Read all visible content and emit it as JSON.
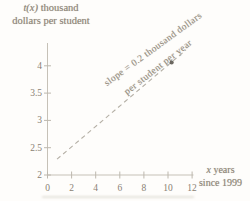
{
  "colors": {
    "background": "#fefdfb",
    "text": "#8e8577",
    "axis": "#c6c1b7",
    "tick": "#bdb8ae",
    "tick_label": "#8a8173",
    "dashed_line": "#b5b0a6",
    "point": "#57524a"
  },
  "ylabel": {
    "var": "t(x)",
    "rest": " thousand",
    "line2": "dollars per student"
  },
  "xlabel": {
    "var": "x",
    "rest": " years",
    "line2": "since 1999"
  },
  "annotation": {
    "line1": "slope = 0.2 thousand dollars",
    "line2": "per student per year"
  },
  "chart_data": {
    "type": "line",
    "title": "",
    "xlabel": "x years since 1999",
    "ylabel": "t(x) thousand dollars per student",
    "x_ticks": [
      0,
      2,
      4,
      6,
      8,
      10,
      12
    ],
    "y_ticks": [
      2,
      2.5,
      3,
      3.5,
      4
    ],
    "xlim": [
      0,
      12.2
    ],
    "ylim": [
      2,
      4.45
    ],
    "grid": false,
    "legend": "none",
    "series": [
      {
        "name": "t(x)",
        "style": "dashed",
        "slope": 0.2,
        "points": [
          [
            0.79,
            2.29
          ],
          [
            11.49,
            4.29
          ]
        ]
      }
    ],
    "marked_point": [
      10.3,
      4.06
    ],
    "annotation": "slope = 0.2 thousand dollars per student per year"
  }
}
